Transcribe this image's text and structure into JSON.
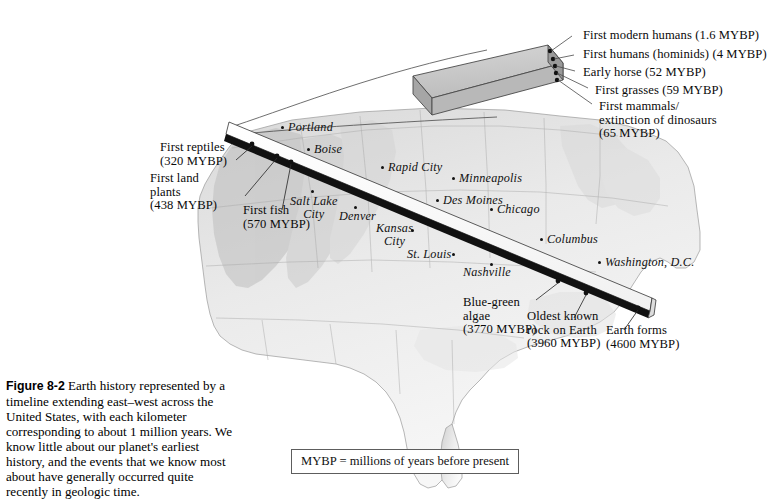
{
  "figure": {
    "number": "Figure 8-2",
    "caption": "Earth history represented by a timeline extending east–west across the United States, with each kilometer corresponding to about 1 million years. We know little about our planet's earliest history, and the events that we know most about have generally occurred quite recently in geologic time."
  },
  "legend": {
    "key_text": "MYBP = millions of years before present"
  },
  "colors": {
    "timeline_band": "#ffffff",
    "timeline_edge": "#0a0a0a",
    "block_top": "#c9c9c9",
    "block_side": "#9a9a9a",
    "block_front": "#b4b4b4",
    "map_land": "#f2f2f2",
    "map_outline": "#8d8d8d",
    "text": "#0a0a0a"
  },
  "inset_block": {
    "name": "magnified-timeline-segment",
    "event_marker_count": 5
  },
  "events": [
    {
      "id": "first-modern-humans",
      "label": "First modern humans (1.6 MYBP)",
      "mybp": 1.6,
      "side": "inset"
    },
    {
      "id": "first-humans",
      "label": "First humans (hominids) (4 MYBP)",
      "mybp": 4,
      "side": "inset"
    },
    {
      "id": "early-horse",
      "label": "Early horse (52 MYBP)",
      "mybp": 52,
      "side": "inset"
    },
    {
      "id": "first-grasses",
      "label": "First grasses (59 MYBP)",
      "mybp": 59,
      "side": "inset"
    },
    {
      "id": "first-mammals",
      "label": "First mammals/\nextinction of dinosaurs\n(65 MYBP)",
      "mybp": 65,
      "side": "inset"
    },
    {
      "id": "first-reptiles",
      "label": "First reptiles\n(320 MYBP)",
      "mybp": 320,
      "side": "map"
    },
    {
      "id": "first-land-plants",
      "label": "First land\nplants\n(438 MYBP)",
      "mybp": 438,
      "side": "map"
    },
    {
      "id": "first-fish",
      "label": "First fish\n(570 MYBP)",
      "mybp": 570,
      "side": "map"
    },
    {
      "id": "blue-green-algae",
      "label": "Blue-green\nalgae\n(3770 MYBP)",
      "mybp": 3770,
      "side": "map"
    },
    {
      "id": "oldest-known-rock",
      "label": "Oldest known\nrock on Earth\n(3960 MYBP)",
      "mybp": 3960,
      "side": "map"
    },
    {
      "id": "earth-forms",
      "label": "Earth forms\n(4600 MYBP)",
      "mybp": 4600,
      "side": "map"
    }
  ],
  "cities": [
    {
      "id": "portland",
      "label": "Portland"
    },
    {
      "id": "boise",
      "label": "Boise"
    },
    {
      "id": "rapid-city",
      "label": "Rapid City"
    },
    {
      "id": "minneapolis",
      "label": "Minneapolis"
    },
    {
      "id": "des-moines",
      "label": "Des Moines"
    },
    {
      "id": "salt-lake-city",
      "label": "Salt Lake\nCity"
    },
    {
      "id": "denver",
      "label": "Denver"
    },
    {
      "id": "chicago",
      "label": "Chicago"
    },
    {
      "id": "columbus",
      "label": "Columbus"
    },
    {
      "id": "kansas-city",
      "label": "Kansas\nCity"
    },
    {
      "id": "st-louis",
      "label": "St. Louis"
    },
    {
      "id": "nashville",
      "label": "Nashville"
    },
    {
      "id": "washington-dc",
      "label": "Washington, D.C."
    }
  ]
}
